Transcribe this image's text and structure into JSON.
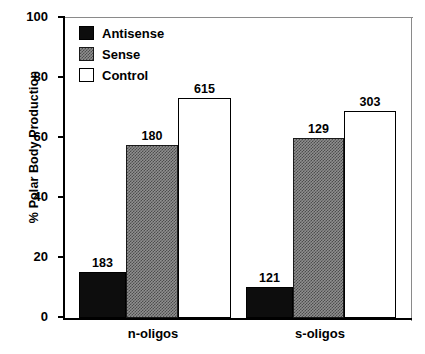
{
  "chart_data": {
    "type": "bar",
    "title": "",
    "xlabel": "",
    "ylabel": "% Polar Body Production",
    "ylim": [
      0,
      100
    ],
    "yticks": [
      0,
      20,
      40,
      60,
      80,
      100
    ],
    "ytick_labels": [
      "0",
      "20",
      "40",
      "60",
      "80",
      "100"
    ],
    "grid": false,
    "legend_position": "upper-left-inside",
    "categories": [
      "n-oligos",
      "s-oligos"
    ],
    "series": [
      {
        "name": "Antisense",
        "color": "#0d0d0d",
        "fill": "solid-black",
        "values": [
          15.5,
          10.5
        ],
        "point_labels": [
          "183",
          "121"
        ]
      },
      {
        "name": "Sense",
        "color": "#8f8f8f",
        "fill": "checkered-gray",
        "values": [
          57.6,
          60.0
        ],
        "point_labels": [
          "180",
          "129"
        ]
      },
      {
        "name": "Control",
        "color": "#ffffff",
        "fill": "white-outlined",
        "values": [
          73.5,
          69.0
        ],
        "point_labels": [
          "615",
          "303"
        ]
      }
    ],
    "annotation_note": "Numbers above each bar are sample counts (n)."
  },
  "legend": {
    "items": [
      {
        "label": "Antisense",
        "swatch": "antisense"
      },
      {
        "label": "Sense",
        "swatch": "sense"
      },
      {
        "label": "Control",
        "swatch": "control"
      }
    ]
  },
  "axis": {
    "y_title": "% Polar Body Production"
  },
  "colors": {
    "antisense": "#0d0d0d",
    "sense": "#8f8f8f",
    "control": "#ffffff",
    "axis": "#000000"
  }
}
